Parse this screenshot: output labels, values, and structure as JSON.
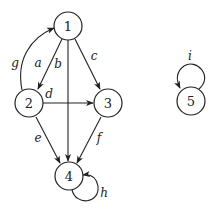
{
  "diagram": {
    "type": "directed-graph",
    "nodes": [
      {
        "id": "1",
        "label": "1",
        "x": 68,
        "y": 26
      },
      {
        "id": "2",
        "label": "2",
        "x": 29,
        "y": 103
      },
      {
        "id": "3",
        "label": "3",
        "x": 108,
        "y": 103
      },
      {
        "id": "4",
        "label": "4",
        "x": 69,
        "y": 176
      },
      {
        "id": "5",
        "label": "5",
        "x": 191,
        "y": 101
      }
    ],
    "edges": [
      {
        "id": "a",
        "label": "a",
        "from": "1",
        "to": "2"
      },
      {
        "id": "b",
        "label": "b",
        "from": "1",
        "to": "4"
      },
      {
        "id": "c",
        "label": "c",
        "from": "1",
        "to": "3"
      },
      {
        "id": "d",
        "label": "d",
        "from": "2",
        "to": "3"
      },
      {
        "id": "e",
        "label": "e",
        "from": "2",
        "to": "4"
      },
      {
        "id": "f",
        "label": "f",
        "from": "3",
        "to": "4"
      },
      {
        "id": "g",
        "label": "g",
        "from": "2",
        "to": "1"
      },
      {
        "id": "h",
        "label": "h",
        "from": "4",
        "to": "4"
      },
      {
        "id": "i",
        "label": "i",
        "from": "5",
        "to": "5"
      }
    ]
  }
}
